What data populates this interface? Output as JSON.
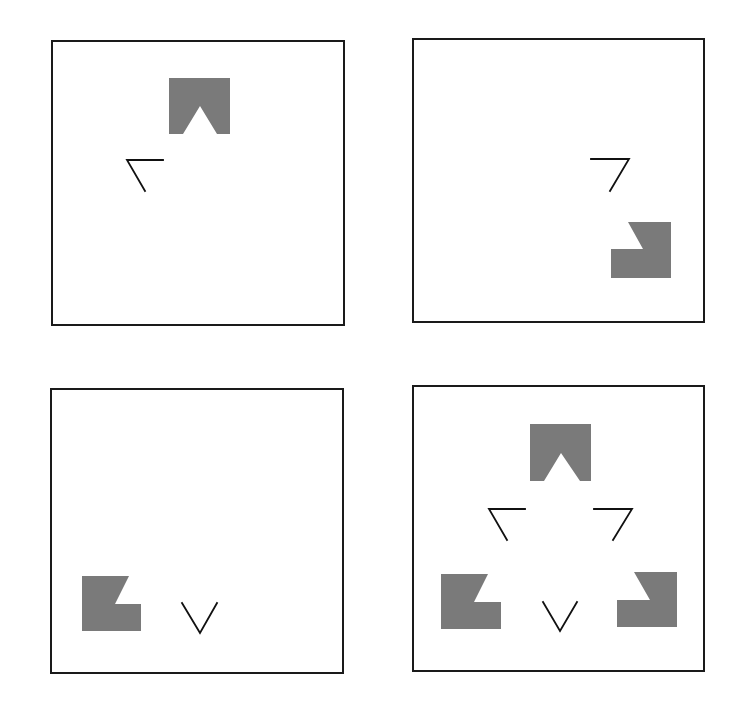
{
  "figure": {
    "colors": {
      "frame": "#1a1a1a",
      "inducer_fill": "#7a7a7a",
      "line": "#111111",
      "background": "#ffffff"
    },
    "panels": [
      {
        "id": "top-left",
        "frame": {
          "x": 52,
          "y": 41,
          "w": 292,
          "h": 284
        },
        "inducers": [
          "top"
        ],
        "contours": [
          "left-angle"
        ]
      },
      {
        "id": "top-right",
        "frame": {
          "x": 413,
          "y": 39,
          "w": 291,
          "h": 283
        },
        "inducers": [
          "bottom-right"
        ],
        "contours": [
          "right-angle"
        ]
      },
      {
        "id": "bottom-left",
        "frame": {
          "x": 51,
          "y": 389,
          "w": 292,
          "h": 284
        },
        "inducers": [
          "bottom-left"
        ],
        "contours": [
          "bottom-v"
        ]
      },
      {
        "id": "bottom-right",
        "frame": {
          "x": 413,
          "y": 386,
          "w": 291,
          "h": 285
        },
        "inducers": [
          "top",
          "bottom-left",
          "bottom-right"
        ],
        "contours": [
          "left-angle",
          "right-angle",
          "bottom-v"
        ]
      }
    ]
  }
}
